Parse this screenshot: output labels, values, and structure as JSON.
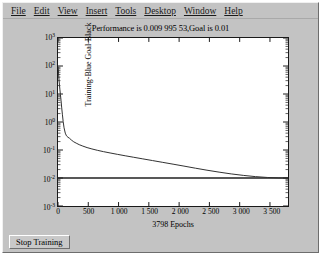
{
  "window": {
    "background_color": "#c3c3c3"
  },
  "menubar": {
    "items": [
      {
        "label": "File",
        "mnemonic": "F"
      },
      {
        "label": "Edit",
        "mnemonic": "E"
      },
      {
        "label": "View",
        "mnemonic": "V"
      },
      {
        "label": "Insert",
        "mnemonic": "I"
      },
      {
        "label": "Tools",
        "mnemonic": "T"
      },
      {
        "label": "Desktop",
        "mnemonic": "D"
      },
      {
        "label": "Window",
        "mnemonic": "W"
      },
      {
        "label": "Help",
        "mnemonic": "H"
      }
    ]
  },
  "toolbar": {
    "stop_training_label": "Stop Training"
  },
  "chart_data": {
    "type": "line",
    "title": "Performance is 0.009 995 53,Goal is 0.01",
    "xlabel": "3798 Epochs",
    "ylabel": "Training-Blue  Goal-Black",
    "yscale": "log",
    "xscale": "linear",
    "xlim": [
      0,
      3798
    ],
    "ylim": [
      0.001,
      1000
    ],
    "grid": false,
    "legend_position": "none",
    "xticks": [
      0,
      500,
      1000,
      1500,
      2000,
      2500,
      3000,
      3500
    ],
    "xticklabels": [
      "0",
      "500",
      "1 000",
      "1 500",
      "2 000",
      "2 500",
      "3 000",
      "3 500"
    ],
    "yticks": [
      1000,
      100,
      10,
      1,
      0.1,
      0.01,
      0.001
    ],
    "yticklabels": [
      "10³",
      "10²",
      "10¹",
      "10⁰",
      "10⁻¹",
      "10⁻²",
      "10⁻³"
    ],
    "ytick_mantissa": [
      "10",
      "10",
      "10",
      "10",
      "10",
      "10",
      "10"
    ],
    "ytick_exponent": [
      "3",
      "2",
      "1",
      "0",
      "-1",
      "-2",
      "-3"
    ],
    "series": [
      {
        "name": "Training-Blue",
        "color": "#303030",
        "x": [
          0,
          5,
          10,
          18,
          25,
          32,
          40,
          50,
          60,
          72,
          85,
          100,
          120,
          140,
          165,
          190,
          220,
          260,
          300,
          350,
          410,
          480,
          560,
          650,
          750,
          860,
          980,
          1110,
          1250,
          1400,
          1560,
          1730,
          1900,
          2080,
          2270,
          2460,
          2660,
          2860,
          3060,
          3260,
          3460,
          3640,
          3798
        ],
        "y": [
          95,
          80,
          52,
          30,
          20,
          14,
          9.5,
          6.0,
          3.4,
          1.9,
          1.05,
          0.62,
          0.4,
          0.32,
          0.285,
          0.262,
          0.228,
          0.196,
          0.176,
          0.155,
          0.138,
          0.122,
          0.109,
          0.0975,
          0.0875,
          0.0785,
          0.07,
          0.0622,
          0.055,
          0.0482,
          0.042,
          0.0362,
          0.0312,
          0.0266,
          0.0224,
          0.019,
          0.0162,
          0.014,
          0.0124,
          0.0112,
          0.01045,
          0.01008,
          0.0099955
        ]
      },
      {
        "name": "Goal-Black",
        "color": "#202020",
        "constant_y": 0.01,
        "x": [
          0,
          3798
        ],
        "y": [
          0.01,
          0.01
        ]
      }
    ],
    "annotations": {
      "performance_value": "0.009 995 53",
      "goal_value": "0.01",
      "epochs": "3798"
    }
  }
}
